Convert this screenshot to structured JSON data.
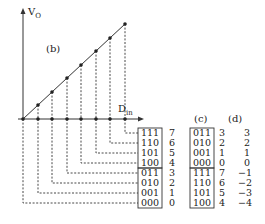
{
  "diagram": {
    "axis_y_label": "V",
    "axis_y_sub": "O",
    "axis_x_label": "D",
    "axis_x_sub": "in",
    "panel_b": "(b)",
    "panel_c": "(c)",
    "panel_d": "(d)",
    "unsigned_codes": [
      {
        "code": "111",
        "value": "7"
      },
      {
        "code": "110",
        "value": "6"
      },
      {
        "code": "101",
        "value": "5"
      },
      {
        "code": "100",
        "value": "4"
      },
      {
        "code": "011",
        "value": "3"
      },
      {
        "code": "010",
        "value": "2"
      },
      {
        "code": "001",
        "value": "1"
      },
      {
        "code": "000",
        "value": "0"
      }
    ],
    "offset_codes": [
      {
        "code": "011",
        "unsigned": "3",
        "signed": "3"
      },
      {
        "code": "010",
        "unsigned": "2",
        "signed": "2"
      },
      {
        "code": "001",
        "unsigned": "1",
        "signed": "1"
      },
      {
        "code": "000",
        "unsigned": "0",
        "signed": "0"
      },
      {
        "code": "111",
        "unsigned": "7",
        "signed": "−1"
      },
      {
        "code": "110",
        "unsigned": "6",
        "signed": "−2"
      },
      {
        "code": "101",
        "unsigned": "5",
        "signed": "−3"
      },
      {
        "code": "100",
        "unsigned": "4",
        "signed": "−4"
      }
    ]
  }
}
